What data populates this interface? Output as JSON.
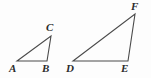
{
  "figure": {
    "background_color": "#fdfdfd",
    "stroke_color": "#4a4a4a",
    "label_color": "#2b2b2b",
    "triangles": [
      {
        "name": "triangle-abc",
        "vertices": [
          {
            "label": "A",
            "x": 17,
            "y": 61,
            "label_x": 9,
            "label_y": 63
          },
          {
            "label": "B",
            "x": 47,
            "y": 61,
            "label_x": 42,
            "label_y": 63
          },
          {
            "label": "C",
            "x": 51,
            "y": 36,
            "label_x": 46,
            "label_y": 22
          }
        ],
        "points": "17,61 47,61 51,36"
      },
      {
        "name": "triangle-def",
        "vertices": [
          {
            "label": "D",
            "x": 73,
            "y": 61,
            "label_x": 66,
            "label_y": 63
          },
          {
            "label": "E",
            "x": 128,
            "y": 61,
            "label_x": 121,
            "label_y": 63
          },
          {
            "label": "F",
            "x": 135,
            "y": 14,
            "label_x": 131,
            "label_y": 1
          }
        ],
        "points": "73,61 128,61 135,14"
      }
    ]
  }
}
